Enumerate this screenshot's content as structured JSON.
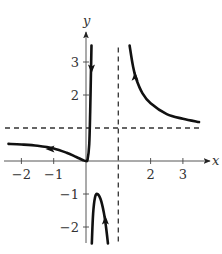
{
  "chart_data": {
    "type": "line",
    "title": "",
    "xlabel": "x",
    "ylabel": "y",
    "xlim": [
      -2.4,
      3.6
    ],
    "ylim": [
      -2.5,
      3.5
    ],
    "grid": false,
    "x_ticks": [
      -2,
      -1,
      2,
      3
    ],
    "x_tick_labels": [
      "−2",
      "−1",
      "2",
      "3"
    ],
    "y_ticks": [
      -2,
      -1,
      2,
      3
    ],
    "y_tick_labels": [
      "−2",
      "−1",
      "2",
      "3"
    ],
    "asymptotes": {
      "vertical": [
        {
          "x": 1,
          "style": "dashed"
        }
      ],
      "horizontal": [
        {
          "y": 1,
          "style": "dashed"
        }
      ]
    },
    "series": [
      {
        "name": "left-branch",
        "description": "Approaches y=0.5 as x-> -inf, dips to origin, rises steeply to +inf just right of x=0",
        "points": [
          [
            -2.4,
            0.52
          ],
          [
            -2,
            0.5
          ],
          [
            -1.5,
            0.46
          ],
          [
            -1,
            0.38
          ],
          [
            -0.6,
            0.25
          ],
          [
            -0.3,
            0.12
          ],
          [
            -0.1,
            0.03
          ],
          [
            0,
            0.0
          ],
          [
            0.05,
            0.05
          ],
          [
            0.1,
            0.5
          ],
          [
            0.13,
            1.5
          ],
          [
            0.15,
            2.5
          ],
          [
            0.17,
            3.5
          ]
        ],
        "arrows": [
          {
            "at": [
              -1.1,
              0.36
            ],
            "direction": "left"
          },
          {
            "at": [
              0.17,
              2.8
            ],
            "direction": "down"
          }
        ]
      },
      {
        "name": "lower-branch",
        "description": "Inverted U below x-axis between x=0.2 and x=0.7 with maximum near (0.35, -1)",
        "points": [
          [
            0.18,
            -2.5
          ],
          [
            0.22,
            -1.6
          ],
          [
            0.28,
            -1.1
          ],
          [
            0.35,
            -1.0
          ],
          [
            0.45,
            -1.15
          ],
          [
            0.55,
            -1.55
          ],
          [
            0.62,
            -2.0
          ],
          [
            0.68,
            -2.5
          ]
        ],
        "arrows": [
          {
            "at": [
              0.6,
              -1.8
            ],
            "direction": "up"
          }
        ]
      },
      {
        "name": "right-branch",
        "description": "Decreases from +inf near x=1.35 toward horizontal asymptote y=1",
        "points": [
          [
            1.35,
            3.5
          ],
          [
            1.45,
            2.9
          ],
          [
            1.55,
            2.5
          ],
          [
            1.75,
            2.05
          ],
          [
            2.0,
            1.75
          ],
          [
            2.5,
            1.42
          ],
          [
            3.0,
            1.28
          ],
          [
            3.5,
            1.18
          ]
        ],
        "arrows": [
          {
            "at": [
              1.52,
              2.55
            ],
            "direction": "up"
          }
        ]
      }
    ],
    "annotations": []
  }
}
